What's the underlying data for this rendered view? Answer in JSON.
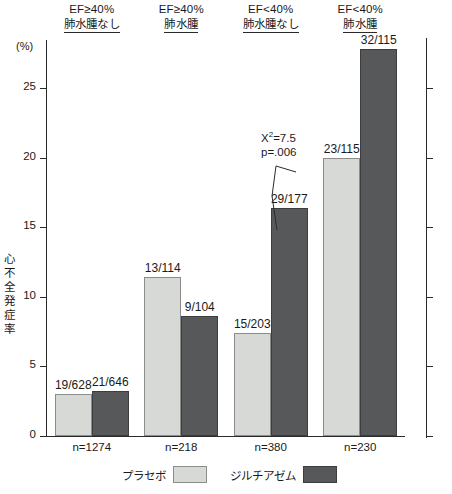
{
  "chart_data": {
    "type": "bar",
    "title": "",
    "xlabel": "",
    "ylabel": "心不全発症率",
    "yunit": "(%)",
    "ylim": [
      0,
      28.5
    ],
    "yticks": [
      0,
      5,
      10,
      15,
      20,
      25
    ],
    "ytick_labels": [
      "0",
      "5",
      "10",
      "15",
      "20",
      "25"
    ],
    "grid": false,
    "legend_position": "bottom",
    "categories": [
      {
        "line1": "EF≥40%",
        "line2": "肺水腫なし",
        "n": "n=1274"
      },
      {
        "line1": "EF≥40%",
        "line2": "肺水腫",
        "n": "n=218"
      },
      {
        "line1": "EF<40%",
        "line2": "肺水腫なし",
        "n": "n=380"
      },
      {
        "line1": "EF<40%",
        "line2": "肺水腫",
        "n": "n=230"
      }
    ],
    "series": [
      {
        "name": "プラセボ",
        "color": "#d7d9d6",
        "values": [
          3.03,
          11.4,
          7.39,
          20.0
        ],
        "labels": [
          "19/628",
          "13/114",
          "15/203",
          "23/115"
        ]
      },
      {
        "name": "ジルチアゼム",
        "color": "#57585a",
        "values": [
          3.25,
          8.65,
          16.38,
          27.83
        ],
        "labels": [
          "21/646",
          "9/104",
          "29/177",
          "32/115"
        ]
      }
    ],
    "annotations": [
      {
        "id": "chi-square-annotation",
        "line1": "X",
        "line1_sup": "2",
        "line1_rest": "=7.5",
        "line2": "p=.006",
        "target_group": 3,
        "target_series": "ジルチアゼム"
      }
    ]
  }
}
